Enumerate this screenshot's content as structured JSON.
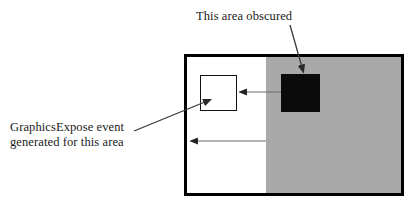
{
  "figure": {
    "title_text": "X11 GraphicsExpose diagram",
    "background_color": "#ffffff"
  },
  "labels": {
    "obscured": "This area obscured",
    "graphics_expose_line1": "GraphicsExpose event",
    "graphics_expose_line2": "generated for this area",
    "graphics_expose_full": "GraphicsExpose event\ngenerated for this area"
  },
  "shapes": {
    "window": {
      "name": "window-rectangle",
      "x": 184,
      "y": 54,
      "width": 220,
      "height": 142,
      "border_color": "#000000",
      "border_width": 3,
      "fill_color": "#ffffff"
    },
    "gray_region": {
      "name": "obscuring-window-region",
      "fill_color": "#a9a9a9",
      "split_x": 266
    },
    "black_square": {
      "name": "obscured-area-square",
      "x": 281,
      "y": 74,
      "width": 39,
      "height": 38,
      "fill_color": "#0b0b0b"
    },
    "white_square": {
      "name": "graphics-expose-area-square",
      "x": 200,
      "y": 75,
      "width": 37,
      "height": 36,
      "fill_color": "#ffffff",
      "border_color": "#111111"
    }
  },
  "arrows": {
    "obscured_pointer": {
      "name": "arrow-to-black-square",
      "from_x": 290,
      "from_y": 25,
      "to_x": 303,
      "to_y": 73,
      "color": "#3a3a3a"
    },
    "copy_arrow_upper": {
      "name": "arrow-black-square-to-white-square",
      "from_x": 281,
      "from_y": 92,
      "to_x": 238,
      "to_y": 92,
      "color": "#5a5a5a"
    },
    "copy_arrow_lower": {
      "name": "arrow-gray-edge-to-window-left",
      "from_x": 266,
      "from_y": 141,
      "to_x": 189,
      "to_y": 141,
      "color": "#5a5a5a"
    },
    "label_pointer": {
      "name": "arrow-label-to-white-square",
      "from_x": 134,
      "from_y": 131,
      "to_x": 211,
      "to_y": 99,
      "color": "#3a3a3a"
    }
  }
}
